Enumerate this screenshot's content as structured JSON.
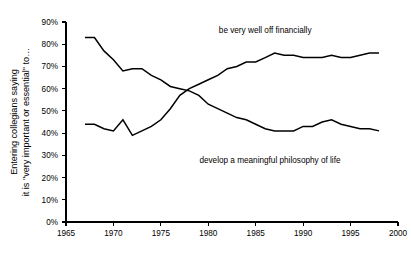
{
  "chart_data": {
    "type": "line",
    "title": "",
    "subtitle": "",
    "xlabel": "",
    "ylabel": "Entering collegians saying it is \"very important or essential\" to…",
    "ylabel_line1": "Entering collegians saying",
    "ylabel_line2": "it is \"very important or essential\" to…",
    "xlim": [
      1965,
      2000
    ],
    "ylim": [
      0,
      90
    ],
    "grid": false,
    "legend_position": "inline-annotations",
    "xticks": [
      1965,
      1970,
      1975,
      1980,
      1985,
      1990,
      1995,
      2000
    ],
    "xtick_labels": [
      "1965",
      "1970",
      "1975",
      "1980",
      "1985",
      "1990",
      "1995",
      "2000"
    ],
    "yticks": [
      0,
      10,
      20,
      30,
      40,
      50,
      60,
      70,
      80,
      90
    ],
    "ytick_labels": [
      "0%",
      "10%",
      "20%",
      "30%",
      "40%",
      "50%",
      "60%",
      "70%",
      "80%",
      "90%"
    ],
    "annotations": [
      {
        "text": "be very well off financially",
        "x": 1986.0,
        "y": 85.0
      },
      {
        "text": "develop a meaningful philosophy of life",
        "x": 1986.5,
        "y": 26.5
      }
    ],
    "series": [
      {
        "name": "develop a meaningful philosophy of life",
        "x": [
          1967,
          1968,
          1969,
          1970,
          1971,
          1972,
          1973,
          1974,
          1975,
          1976,
          1977,
          1978,
          1979,
          1980,
          1981,
          1982,
          1983,
          1984,
          1985,
          1986,
          1987,
          1988,
          1989,
          1990,
          1991,
          1992,
          1993,
          1994,
          1995,
          1996,
          1997,
          1998
        ],
        "values": [
          83,
          83,
          77,
          73,
          68,
          69,
          69,
          66,
          64,
          61,
          60,
          59,
          57,
          53,
          51,
          49,
          47,
          46,
          44,
          42,
          41,
          41,
          41,
          43,
          43,
          45,
          46,
          44,
          43,
          42,
          42,
          41
        ]
      },
      {
        "name": "be very well off financially",
        "x": [
          1967,
          1968,
          1969,
          1970,
          1971,
          1972,
          1973,
          1974,
          1975,
          1976,
          1977,
          1978,
          1979,
          1980,
          1981,
          1982,
          1983,
          1984,
          1985,
          1986,
          1987,
          1988,
          1989,
          1990,
          1991,
          1992,
          1993,
          1994,
          1995,
          1996,
          1997,
          1998
        ],
        "values": [
          44,
          44,
          42,
          41,
          46,
          39,
          41,
          43,
          46,
          51,
          57,
          60,
          62,
          64,
          66,
          69,
          70,
          72,
          72,
          74,
          76,
          75,
          75,
          74,
          74,
          74,
          75,
          74,
          74,
          75,
          76,
          76
        ]
      }
    ]
  },
  "plot_geometry": {
    "left": 66,
    "right": 398,
    "top": 22,
    "bottom": 222
  }
}
